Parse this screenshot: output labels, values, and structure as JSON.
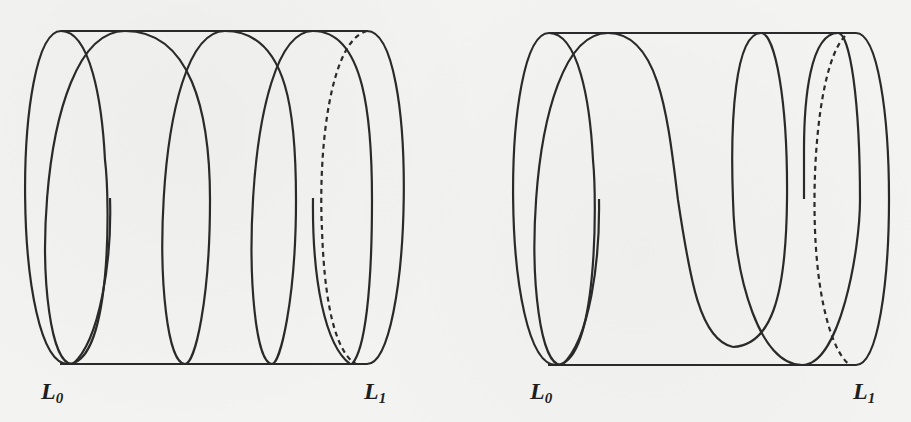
{
  "figure": {
    "type": "cobordism-diagram",
    "panels": [
      {
        "id": "left",
        "labels": {
          "start": {
            "base": "L",
            "sub": "0"
          },
          "end": {
            "base": "L",
            "sub": "1"
          }
        },
        "description": "Cylinder of elliptical loops from L0 to L1 with a dashed back-edge at L1"
      },
      {
        "id": "right",
        "labels": {
          "start": {
            "base": "L",
            "sub": "0"
          },
          "end": {
            "base": "L",
            "sub": "1"
          }
        },
        "description": "Cylinder of loops from L0 to L1 with one loop dipping below the top rail; dashed back-edge at L1"
      }
    ],
    "colors": {
      "ink": "#2a2a2a",
      "paper": "#f3f3f1"
    }
  }
}
